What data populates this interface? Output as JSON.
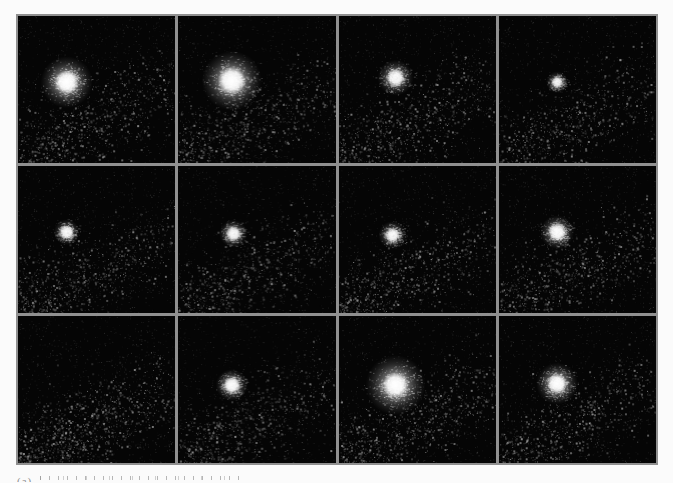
{
  "page": {
    "background": "#fbfbfb",
    "width": 673,
    "height": 483
  },
  "figure": {
    "rows": 3,
    "cols": 4,
    "grid_line_color": "#909090",
    "panel_bg": "#050505",
    "content": "grid of twelve astronomical images; bright fuzzy point source over diffuse nebulosity",
    "panels": [
      {
        "id": "r1c1",
        "row": 1,
        "col": 1,
        "seed": 101,
        "nebula": 1.0,
        "blob": {
          "x": 0.31,
          "y": 0.45,
          "core_r": 12,
          "halo_r": 26,
          "intensity": 1.0
        }
      },
      {
        "id": "r1c2",
        "row": 1,
        "col": 2,
        "seed": 102,
        "nebula": 1.05,
        "blob": {
          "x": 0.34,
          "y": 0.44,
          "core_r": 14,
          "halo_r": 30,
          "intensity": 1.05
        }
      },
      {
        "id": "r1c3",
        "row": 1,
        "col": 3,
        "seed": 103,
        "nebula": 1.0,
        "blob": {
          "x": 0.36,
          "y": 0.42,
          "core_r": 9,
          "halo_r": 18,
          "intensity": 0.85
        }
      },
      {
        "id": "r1c4",
        "row": 1,
        "col": 4,
        "seed": 104,
        "nebula": 0.95,
        "blob": {
          "x": 0.37,
          "y": 0.45,
          "core_r": 5,
          "halo_r": 11,
          "intensity": 0.7
        }
      },
      {
        "id": "r2c1",
        "row": 2,
        "col": 1,
        "seed": 105,
        "nebula": 0.95,
        "blob": {
          "x": 0.31,
          "y": 0.45,
          "core_r": 7,
          "halo_r": 13,
          "intensity": 0.8
        }
      },
      {
        "id": "r2c2",
        "row": 2,
        "col": 2,
        "seed": 106,
        "nebula": 1.0,
        "blob": {
          "x": 0.35,
          "y": 0.46,
          "core_r": 7,
          "halo_r": 14,
          "intensity": 0.8
        }
      },
      {
        "id": "r2c3",
        "row": 2,
        "col": 3,
        "seed": 107,
        "nebula": 1.0,
        "blob": {
          "x": 0.34,
          "y": 0.47,
          "core_r": 7,
          "halo_r": 14,
          "intensity": 0.8
        }
      },
      {
        "id": "r2c4",
        "row": 2,
        "col": 4,
        "seed": 108,
        "nebula": 1.0,
        "blob": {
          "x": 0.37,
          "y": 0.45,
          "core_r": 9,
          "halo_r": 17,
          "intensity": 0.9
        }
      },
      {
        "id": "r3c1",
        "row": 3,
        "col": 1,
        "seed": 109,
        "nebula": 1.3,
        "blob": null
      },
      {
        "id": "r3c2",
        "row": 3,
        "col": 2,
        "seed": 110,
        "nebula": 1.0,
        "blob": {
          "x": 0.34,
          "y": 0.47,
          "core_r": 8,
          "halo_r": 16,
          "intensity": 0.9
        }
      },
      {
        "id": "r3c3",
        "row": 3,
        "col": 3,
        "seed": 111,
        "nebula": 1.05,
        "blob": {
          "x": 0.36,
          "y": 0.47,
          "core_r": 13,
          "halo_r": 30,
          "intensity": 1.05
        }
      },
      {
        "id": "r3c4",
        "row": 3,
        "col": 4,
        "seed": 112,
        "nebula": 1.0,
        "blob": {
          "x": 0.37,
          "y": 0.46,
          "core_r": 10,
          "halo_r": 21,
          "intensity": 0.95
        }
      }
    ]
  },
  "caption": {
    "fragment": "(a)",
    "clipped": true
  }
}
